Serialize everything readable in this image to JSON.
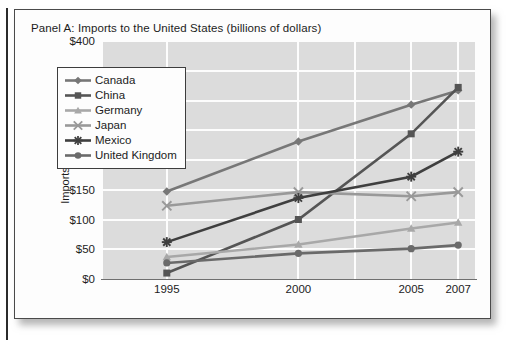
{
  "panel_title": "Panel A: Imports to the United States (billions of dollars)",
  "chart_data": {
    "type": "line",
    "title": "Panel A: Imports to the United States (billions of dollars)",
    "xlabel": "",
    "ylabel": "Imports to the US (billions)",
    "categories": [
      "1995",
      "2000",
      "2005",
      "2007"
    ],
    "category_positions": [
      0.175,
      0.525,
      0.825,
      0.95
    ],
    "ylim": [
      0,
      400
    ],
    "ytick_values": [
      0,
      50,
      100,
      150,
      200,
      250,
      300,
      350,
      400
    ],
    "ytick_labels": [
      "$0",
      "$50",
      "$100",
      "$150",
      "$200",
      "$250",
      "$300",
      "$350",
      "$400"
    ],
    "grid": true,
    "legend_position": "upper left",
    "series": [
      {
        "name": "Canada",
        "marker": "diamond",
        "color": "#777777",
        "values": [
          147,
          231,
          293,
          317
        ]
      },
      {
        "name": "China",
        "marker": "square",
        "color": "#555555",
        "values": [
          10,
          100,
          244,
          322
        ]
      },
      {
        "name": "Germany",
        "marker": "triangle",
        "color": "#a8a8a8",
        "values": [
          37,
          58,
          85,
          95
        ]
      },
      {
        "name": "Japan",
        "marker": "cross",
        "color": "#999999",
        "values": [
          123,
          146,
          139,
          146
        ]
      },
      {
        "name": "Mexico",
        "marker": "asterisk",
        "color": "#3f3f3f",
        "values": [
          62,
          136,
          172,
          214
        ]
      },
      {
        "name": "United Kingdom",
        "marker": "circle",
        "color": "#6a6a6a",
        "values": [
          27,
          43,
          51,
          57
        ]
      }
    ]
  }
}
